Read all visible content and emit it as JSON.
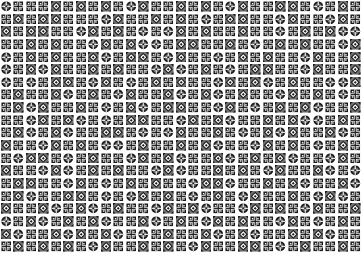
{
  "image": {
    "description": "Black and white ornamental tile mosaic",
    "columns": 29,
    "rows": 20,
    "colors": {
      "dark": "#1a1a1a",
      "mid": "#6e6e6e",
      "light": "#ffffff"
    },
    "tile_types": [
      "circle-cross",
      "diamond",
      "lattice"
    ],
    "tiles": "CLLLDLDLDLCDLLDLDLCDLLDDLCLDLLDLDDLLLCDLLDLDLCLDDLLCDLLCDLDLDDLLCDLDLCLCDLDLLDLLCLDLDCCLLDLDLLCDLDCCLDDLLDLCLDLDLLCDCLDLDLLDCLDDLCDLLCLDLDLLCDLLDCLDCDLLDLDLLCDCLDLCLDDLLCDLLDCLCLDDLCDLCLDLDLLCDLDCLDLLCCDLDLLDCLDLCDLLDCLDCLDLLCDLDLCLLDCDLLDLCLDCLDDLLCDLCLDLDCLLDLLCDLDCLCLDDLLCDLDCLLDLDCCLDLLDCLDCLLDDLCLCDLLDLCLDCDLLDCLDLLCDLDLCCLDLLDLDCLLCDLDLCLDLLCDDLCLDLLCDLDCLLDCLDLDCLLCDLDLLCDCLDLDLLCDCLLDLDLCDLLDCLCLDDLLCDLCLDLDLLCDDCLLDLDCLLDCLDCLLDDLCLCDLDLCLDLCDLLDLCDCLDLLDCLDCLDLLCDLDCLLCDLDLCDLLDCLDCLDLDCLLDCLDLCDLDLLCDLCLDLDCLLDCDLDCLCLDLLDCLDCLLDLD"
  }
}
